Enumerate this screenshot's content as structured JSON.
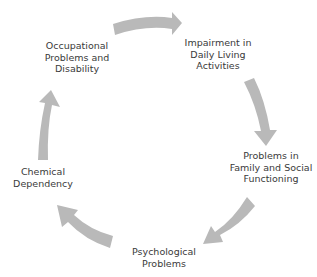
{
  "diagram": {
    "type": "cycle",
    "arrow_color": "#b8b8b8",
    "text_color": "#3a3a3a",
    "background": "#ffffff",
    "nodes": [
      {
        "id": "impairment",
        "lines": [
          "Impairment in",
          "Daily Living",
          "Activities"
        ]
      },
      {
        "id": "family",
        "lines": [
          "Problems in",
          "Family and Social",
          "Functioning"
        ]
      },
      {
        "id": "psychological",
        "lines": [
          "Psychological",
          "Problems"
        ]
      },
      {
        "id": "chemical",
        "lines": [
          "Chemical",
          "Dependency"
        ]
      },
      {
        "id": "occupational",
        "lines": [
          "Occupational",
          "Problems and",
          "Disability"
        ]
      }
    ],
    "edges": [
      {
        "from": "occupational",
        "to": "impairment"
      },
      {
        "from": "impairment",
        "to": "family"
      },
      {
        "from": "family",
        "to": "psychological"
      },
      {
        "from": "psychological",
        "to": "chemical"
      },
      {
        "from": "chemical",
        "to": "occupational"
      }
    ]
  }
}
